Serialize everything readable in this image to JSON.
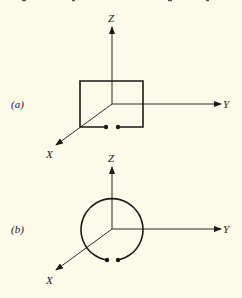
{
  "figure": {
    "background": "#fcfbea",
    "ink": "#1a1a1a",
    "panels": [
      {
        "id": "a",
        "label": "(a)",
        "shape": "rectangular loop with gap at bottom (terminals)",
        "axes": {
          "x": "X",
          "y": "Y",
          "z": "Z"
        },
        "origin": [
          112,
          104
        ]
      },
      {
        "id": "b",
        "label": "(b)",
        "shape": "circular loop with gap at bottom (terminals)",
        "axes": {
          "x": "X",
          "y": "Y",
          "z": "Z"
        },
        "origin": [
          112,
          229
        ]
      }
    ]
  }
}
